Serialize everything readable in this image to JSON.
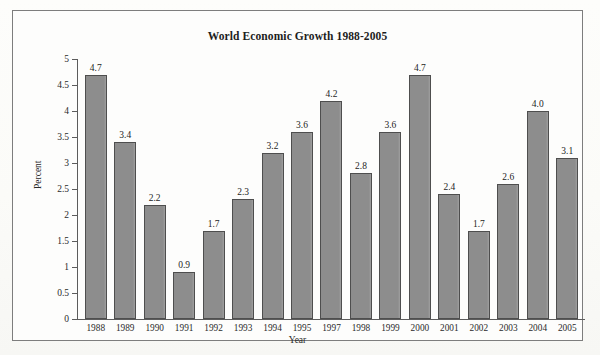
{
  "chart_data": {
    "type": "bar",
    "title": "World Economic Growth 1988-2005",
    "xlabel": "Year",
    "ylabel": "Percent",
    "ylim": [
      0,
      5
    ],
    "ytick_step": 0.5,
    "yticks": [
      "0",
      "0.5",
      "1",
      "1.5",
      "2",
      "2.5",
      "3",
      "3.5",
      "4",
      "4.5",
      "5"
    ],
    "grid": false,
    "legend": "none",
    "categories": [
      "1988",
      "1989",
      "1990",
      "1991",
      "1992",
      "1993",
      "1994",
      "1995",
      "1997",
      "1998",
      "1999",
      "2000",
      "2001",
      "2002",
      "2003",
      "2004",
      "2005"
    ],
    "values": [
      4.7,
      3.4,
      2.2,
      0.9,
      1.7,
      2.3,
      3.2,
      3.6,
      4.2,
      2.8,
      3.6,
      4.7,
      2.4,
      1.7,
      2.6,
      4.0,
      3.1
    ],
    "value_labels": [
      "4.7",
      "3.4",
      "2.2",
      "0.9",
      "1.7",
      "2.3",
      "3.2",
      "3.6",
      "4.2",
      "2.8",
      "3.6",
      "4.7",
      "2.4",
      "1.7",
      "2.6",
      "4.0",
      "3.1"
    ],
    "bar_color": "#8d8d8d",
    "bar_border_color": "#4e4e4e",
    "axis_color": "#5c5c5c",
    "text_color": "#1d1d1d",
    "background_color": "#fdfdfc",
    "frame_border_color": "#7d7d7d"
  }
}
